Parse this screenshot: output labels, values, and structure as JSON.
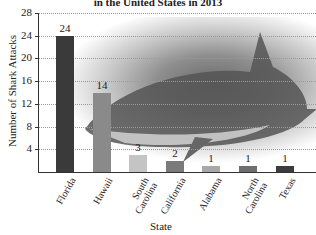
{
  "chart_data": {
    "type": "bar",
    "title": "in the United States in 2013",
    "xlabel": "State",
    "ylabel": "Number of Shark Attacks",
    "ylim": [
      0,
      28
    ],
    "yticks": [
      4,
      8,
      12,
      16,
      20,
      24,
      28
    ],
    "grid": true,
    "categories": [
      "Florida",
      "Hawaii",
      "South Carolina",
      "California",
      "Alabama",
      "North Carolina",
      "Texas"
    ],
    "category_labels": [
      "Florida",
      "Hawaii",
      "South\nCarolina",
      "California",
      "Alabama",
      "North\nCarolina",
      "Texas"
    ],
    "values": [
      24,
      14,
      3,
      2,
      1,
      1,
      1
    ],
    "bar_colors": [
      "#3a3a3a",
      "#8a8a8a",
      "#c4c4c4",
      "#7a7a7a",
      "#a8a8a8",
      "#6e6e6e",
      "#3c3c3c"
    ],
    "background_image": "shark photograph"
  }
}
